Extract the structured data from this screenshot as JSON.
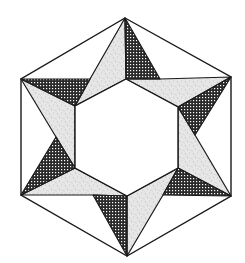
{
  "figure": {
    "colors": {
      "background": "#ffffff",
      "stroke": "#1a1a1a",
      "dark_fill": "#2a2a2a",
      "dark_dot": "#ffffff",
      "light_fill": "#e4e4e4",
      "light_speck": "#b8b8b8",
      "inner_fill": "#ffffff"
    },
    "outer_hexagon": [
      [
        125,
        18
      ],
      [
        231,
        77
      ],
      [
        231,
        196
      ],
      [
        127,
        256
      ],
      [
        21,
        195
      ],
      [
        21,
        79
      ]
    ],
    "inner_hexagon": [
      [
        126,
        79
      ],
      [
        178,
        107
      ],
      [
        178,
        168
      ],
      [
        127,
        196
      ],
      [
        75,
        168
      ],
      [
        75,
        106
      ]
    ],
    "dark_triangles": [
      [
        [
          125,
          18
        ],
        [
          126,
          79
        ],
        [
          160,
          79
        ]
      ],
      [
        [
          231,
          77
        ],
        [
          178,
          107
        ],
        [
          195,
          135
        ]
      ],
      [
        [
          231,
          196
        ],
        [
          178,
          168
        ],
        [
          163,
          195
        ]
      ],
      [
        [
          127,
          256
        ],
        [
          127,
          196
        ],
        [
          93,
          195
        ]
      ],
      [
        [
          21,
          195
        ],
        [
          75,
          168
        ],
        [
          56,
          137
        ]
      ],
      [
        [
          21,
          79
        ],
        [
          75,
          106
        ],
        [
          90,
          79
        ]
      ]
    ],
    "light_quads": [
      [
        [
          125,
          18
        ],
        [
          126,
          79
        ],
        [
          75,
          106
        ],
        [
          90,
          79
        ]
      ],
      [
        [
          231,
          77
        ],
        [
          178,
          107
        ],
        [
          126,
          79
        ],
        [
          160,
          79
        ]
      ],
      [
        [
          231,
          196
        ],
        [
          178,
          168
        ],
        [
          178,
          107
        ],
        [
          195,
          135
        ]
      ],
      [
        [
          127,
          256
        ],
        [
          127,
          196
        ],
        [
          178,
          168
        ],
        [
          163,
          195
        ]
      ],
      [
        [
          21,
          195
        ],
        [
          75,
          168
        ],
        [
          127,
          196
        ],
        [
          93,
          195
        ]
      ],
      [
        [
          21,
          79
        ],
        [
          75,
          106
        ],
        [
          75,
          168
        ],
        [
          56,
          137
        ]
      ]
    ]
  }
}
